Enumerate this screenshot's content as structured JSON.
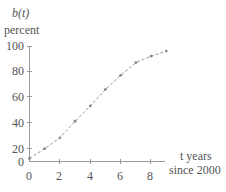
{
  "chart_data": {
    "type": "line",
    "title": "",
    "ylabel": "b(t)",
    "ylabel_unit": "percent",
    "xlabel": "t years",
    "xlabel_sub": "since 2000",
    "x_ticks": [
      0,
      2,
      4,
      6,
      8
    ],
    "y_ticks": [
      0,
      20,
      40,
      60,
      80,
      100
    ],
    "xlim": [
      0,
      9
    ],
    "ylim": [
      0,
      100
    ],
    "grid": false,
    "legend": null,
    "series": [
      {
        "name": "b(t)",
        "x": [
          0,
          1,
          2,
          3,
          4,
          5,
          6,
          7,
          8,
          9
        ],
        "values": [
          4,
          19,
          28,
          41,
          53,
          66,
          77,
          87,
          92,
          96
        ],
        "style": "dashed line with point markers",
        "color": "#999999"
      }
    ]
  },
  "labels": {
    "y_name": "b(t)",
    "y_unit": "percent",
    "x_name": "t years",
    "x_sub": "since 2000"
  },
  "ticks": {
    "y": [
      "100",
      "80",
      "60",
      "40",
      "20",
      "0"
    ],
    "x": [
      "0",
      "2",
      "4",
      "6",
      "8"
    ]
  }
}
